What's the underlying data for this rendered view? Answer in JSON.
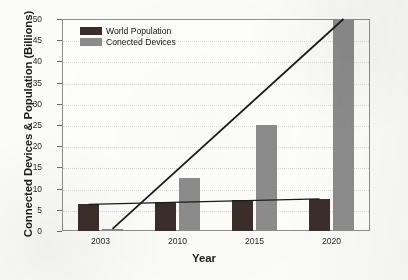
{
  "chart_data": {
    "type": "bar",
    "title": "",
    "xlabel": "Year",
    "ylabel": "Connected Devices & Population (Billions)",
    "categories": [
      "2003",
      "2010",
      "2015",
      "2020"
    ],
    "series": [
      {
        "name": "World Population",
        "color": "#3a2e2a",
        "values": [
          6.3,
          6.8,
          7.2,
          7.6
        ]
      },
      {
        "name": "Conected Devices",
        "color": "#8c8c8c",
        "values": [
          0.5,
          12.5,
          25.0,
          50.0
        ]
      }
    ],
    "ylim": [
      0,
      50
    ],
    "yticks": [
      0,
      5,
      10,
      15,
      20,
      25,
      30,
      35,
      40,
      45,
      50
    ],
    "grid": false,
    "legend_position": "top-left",
    "annotations": [
      {
        "name": "connected-devices-trend-line",
        "from": "2003",
        "to": "2020",
        "style": "straight-line"
      },
      {
        "name": "world-population-trend-line",
        "from": "2003",
        "to": "2020",
        "style": "straight-line"
      }
    ]
  },
  "legend": {
    "items": [
      {
        "label": "World Population",
        "color": "#3a2e2a"
      },
      {
        "label": "Conected Devices",
        "color": "#8c8c8c"
      }
    ]
  },
  "axes": {
    "y_title": "Connected Devices & Population (Billions)",
    "x_title": "Year",
    "y_ticks": [
      "0",
      "5",
      "10",
      "15",
      "20",
      "25",
      "30",
      "35",
      "40",
      "45",
      "50"
    ],
    "x_ticks": [
      "2003",
      "2010",
      "2015",
      "2020"
    ]
  }
}
